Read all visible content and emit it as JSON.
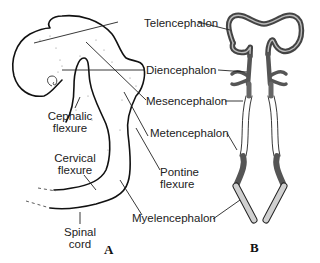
{
  "diagram": {
    "panels": {
      "a": "A",
      "b": "B"
    },
    "labels": {
      "telencephalon": "Telencephalon",
      "diencephalon": "Diencephalon",
      "mesencephalon": "Mesencephalon",
      "metencephalon": "Metencephalon",
      "pontine_flexure_1": "Pontine",
      "pontine_flexure_2": "flexure",
      "myelencephalon": "Myelencephalon",
      "cephalic_flexure_1": "Cephalic",
      "cephalic_flexure_2": "flexure",
      "cervical_flexure_1": "Cervical",
      "cervical_flexure_2": "flexure",
      "spinal_cord_1": "Spinal",
      "spinal_cord_2": "cord"
    },
    "colors": {
      "outline": "#111111",
      "wall_dark": "#555555",
      "wall_mid": "#888888",
      "wall_light": "#d0d0d0",
      "leader": "#222222"
    }
  }
}
